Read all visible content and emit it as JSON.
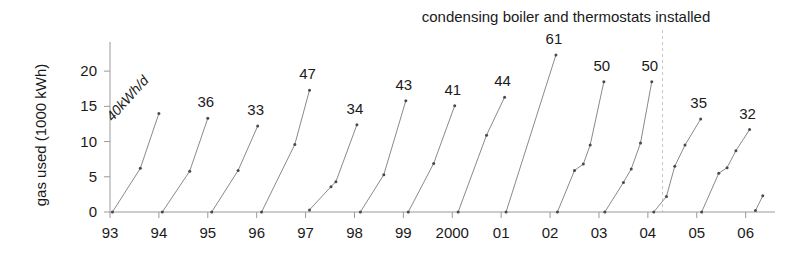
{
  "chart_data": {
    "type": "line",
    "title": "condensing boiler and thermostats installed",
    "xlabel": "",
    "ylabel": "gas used (1000 kWh)",
    "ylim": [
      0,
      23
    ],
    "yticks": [
      0,
      5,
      10,
      15,
      20
    ],
    "ytick_labels": [
      "0",
      "5",
      "10",
      "15",
      "20"
    ],
    "xlim": [
      1993.0,
      2006.6
    ],
    "xticks": [
      1993,
      1994,
      1995,
      1996,
      1997,
      1998,
      1999,
      2000,
      2001,
      2002,
      2003,
      2004,
      2005,
      2006
    ],
    "xtick_labels": [
      "93",
      "94",
      "95",
      "96",
      "97",
      "98",
      "99",
      "2000",
      "01",
      "02",
      "03",
      "04",
      "05",
      "06"
    ],
    "grid": false,
    "legend": null,
    "annotation_unit_label": "40kWh/d",
    "event_marker": {
      "label": "condensing boiler and thermostats installed",
      "x": 2004.3
    },
    "series": [
      {
        "name": "1993",
        "end_label": "40kWh/d",
        "end_label_rotated": true,
        "rate_kwh_per_day": 40,
        "x": [
          1993.05,
          1993.62,
          1994.0
        ],
        "y": [
          0.0,
          6.2,
          14.0
        ]
      },
      {
        "name": "1994",
        "end_label": "36",
        "end_label_rotated": false,
        "rate_kwh_per_day": 36,
        "x": [
          1994.07,
          1994.63,
          1995.0
        ],
        "y": [
          0.0,
          5.8,
          13.3
        ]
      },
      {
        "name": "1995",
        "end_label": "33",
        "end_label_rotated": false,
        "rate_kwh_per_day": 33,
        "x": [
          1995.08,
          1995.62,
          1996.02
        ],
        "y": [
          0.0,
          5.9,
          12.2
        ]
      },
      {
        "name": "1996",
        "end_label": "47",
        "end_label_rotated": false,
        "rate_kwh_per_day": 47,
        "x": [
          1996.1,
          1996.78,
          1997.08
        ],
        "y": [
          0.0,
          9.6,
          17.3
        ]
      },
      {
        "name": "1997",
        "end_label": "34",
        "end_label_rotated": false,
        "rate_kwh_per_day": 34,
        "x": [
          1997.08,
          1997.52,
          1997.62,
          1998.05
        ],
        "y": [
          0.3,
          3.6,
          4.3,
          12.4
        ]
      },
      {
        "name": "1998",
        "end_label": "43",
        "end_label_rotated": false,
        "rate_kwh_per_day": 43,
        "x": [
          1998.12,
          1998.6,
          1999.05
        ],
        "y": [
          0.0,
          5.3,
          15.8
        ]
      },
      {
        "name": "1999",
        "end_label": "41",
        "end_label_rotated": false,
        "rate_kwh_per_day": 41,
        "x": [
          1999.1,
          1999.62,
          2000.05
        ],
        "y": [
          0.0,
          6.9,
          15.1
        ]
      },
      {
        "name": "2000",
        "end_label": "44",
        "end_label_rotated": false,
        "rate_kwh_per_day": 44,
        "x": [
          2000.12,
          2000.7,
          2001.07
        ],
        "y": [
          0.0,
          10.9,
          16.3
        ]
      },
      {
        "name": "2001",
        "end_label": "61",
        "end_label_rotated": false,
        "rate_kwh_per_day": 61,
        "x": [
          2001.1,
          2002.12
        ],
        "y": [
          0.0,
          22.3
        ]
      },
      {
        "name": "2002",
        "end_label": "50",
        "end_label_rotated": false,
        "rate_kwh_per_day": 50,
        "x": [
          2002.15,
          2002.5,
          2002.68,
          2002.82,
          2003.1
        ],
        "y": [
          0.0,
          5.9,
          6.8,
          9.5,
          18.5
        ]
      },
      {
        "name": "2003",
        "end_label": "50",
        "end_label_rotated": false,
        "rate_kwh_per_day": 50,
        "x": [
          2003.12,
          2003.5,
          2003.66,
          2003.85,
          2004.08
        ],
        "y": [
          0.0,
          4.2,
          6.1,
          9.8,
          18.5
        ]
      },
      {
        "name": "2004",
        "end_label": "35",
        "end_label_rotated": false,
        "rate_kwh_per_day": 35,
        "x": [
          2004.12,
          2004.38,
          2004.55,
          2004.76,
          2005.08
        ],
        "y": [
          0.0,
          2.2,
          6.5,
          9.5,
          13.2
        ]
      },
      {
        "name": "2005",
        "end_label": "32",
        "end_label_rotated": false,
        "rate_kwh_per_day": 32,
        "x": [
          2005.1,
          2005.45,
          2005.62,
          2005.8,
          2006.08
        ],
        "y": [
          0.0,
          5.5,
          6.3,
          8.7,
          11.7
        ]
      },
      {
        "name": "2006",
        "end_label": "",
        "end_label_rotated": false,
        "rate_kwh_per_day": null,
        "x": [
          2006.2,
          2006.35
        ],
        "y": [
          0.2,
          2.3
        ]
      }
    ]
  }
}
